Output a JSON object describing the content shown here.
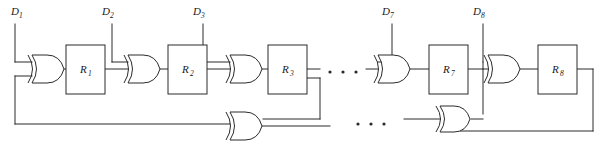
{
  "figure": {
    "type": "logic-circuit-diagram",
    "background_color": "#ffffff",
    "line_color": "#2b2b2b"
  },
  "data_inputs": [
    {
      "id": "d1",
      "label": "D",
      "subscript": "1",
      "x": 18,
      "y": 12,
      "line_x": 15,
      "line_top": 18,
      "line_bottom": 62
    },
    {
      "id": "d2",
      "label": "D",
      "subscript": "2",
      "x": 106,
      "y": 12,
      "line_x": 112,
      "line_top": 18,
      "line_bottom": 62
    },
    {
      "id": "d3",
      "label": "D",
      "subscript": "3",
      "x": 196,
      "y": 12,
      "line_x": 203,
      "line_top": 18,
      "line_bottom": 62
    },
    {
      "id": "d7",
      "label": "D",
      "subscript": "7",
      "x": 388,
      "y": 12,
      "line_x": 392,
      "line_top": 18,
      "line_bottom": 62
    },
    {
      "id": "d8",
      "label": "D",
      "subscript": "8",
      "x": 476,
      "y": 12,
      "line_x": 483,
      "line_top": 18,
      "line_bottom": 62
    }
  ],
  "registers": [
    {
      "id": "r1",
      "label": "R",
      "subscript": "1",
      "x": 66,
      "y": 45,
      "w": 39,
      "h": 49
    },
    {
      "id": "r2",
      "label": "R",
      "subscript": "2",
      "x": 168,
      "y": 45,
      "w": 39,
      "h": 49
    },
    {
      "id": "r3",
      "label": "R",
      "subscript": "3",
      "x": 268,
      "y": 45,
      "w": 39,
      "h": 49
    },
    {
      "id": "r7",
      "label": "R",
      "subscript": "7",
      "x": 429,
      "y": 45,
      "w": 39,
      "h": 49
    },
    {
      "id": "r8",
      "label": "R",
      "subscript": "8",
      "x": 538,
      "y": 45,
      "w": 39,
      "h": 49
    }
  ],
  "xor_gates_top": [
    {
      "id": "xor1",
      "x": 30,
      "y": 55,
      "w": 33,
      "h": 27
    },
    {
      "id": "xor2",
      "x": 126,
      "y": 55,
      "w": 33,
      "h": 27
    },
    {
      "id": "xor3",
      "x": 228,
      "y": 55,
      "w": 33,
      "h": 27
    },
    {
      "id": "xor7",
      "x": 376,
      "y": 55,
      "w": 33,
      "h": 27
    },
    {
      "id": "xor8",
      "x": 486,
      "y": 55,
      "w": 33,
      "h": 27
    }
  ],
  "xor_gates_bottom": [
    {
      "id": "xor-fb-left",
      "x": 228,
      "y": 108,
      "w": 33,
      "h": 26
    },
    {
      "id": "xor-fb-right",
      "x": 438,
      "y": 108,
      "w": 33,
      "h": 26
    }
  ],
  "ellipses": [
    {
      "id": "ellipsis-top",
      "dots": 3,
      "x": 329,
      "y": 72,
      "gap": 13,
      "r": 1.6
    },
    {
      "id": "ellipsis-bottom",
      "dots": 3,
      "x": 357,
      "y": 124,
      "gap": 13,
      "r": 1.6
    }
  ],
  "feedback_bus": {
    "left_rail_x": 15,
    "bottom_rail_y": 124,
    "description": "Output feedback routed along bottom rail into XOR gates"
  }
}
